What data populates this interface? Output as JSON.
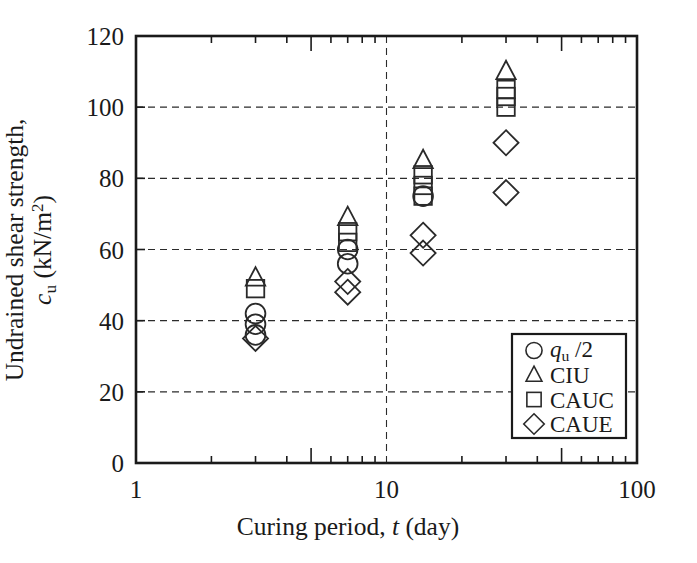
{
  "chart_data": {
    "type": "scatter",
    "title": "",
    "xlabel": "Curing period, t  (day)",
    "ylabel": "Undrained shear strength, c_u (kN/m^2)",
    "xscale": "log",
    "yscale": "linear",
    "xlim": [
      1,
      100
    ],
    "ylim": [
      0,
      120
    ],
    "xticks": [
      "1",
      "10",
      "100"
    ],
    "xtick_values": [
      1,
      10,
      100
    ],
    "yticks": [
      "0",
      "20",
      "40",
      "60",
      "80",
      "100",
      "120"
    ],
    "ytick_values": [
      0,
      20,
      40,
      60,
      80,
      100,
      120
    ],
    "grid": "dashed horizontal and vertical",
    "legend_position": "lower right inside axes",
    "series": [
      {
        "name": "qu/2",
        "marker": "circle",
        "points": [
          {
            "x": 3,
            "y": 42
          },
          {
            "x": 3,
            "y": 39
          },
          {
            "x": 3,
            "y": 36
          },
          {
            "x": 7,
            "y": 60
          },
          {
            "x": 7,
            "y": 56
          },
          {
            "x": 14,
            "y": 75
          }
        ]
      },
      {
        "name": "CIU",
        "marker": "triangle",
        "points": [
          {
            "x": 3,
            "y": 52
          },
          {
            "x": 7,
            "y": 69
          },
          {
            "x": 14,
            "y": 85
          },
          {
            "x": 30,
            "y": 110
          }
        ]
      },
      {
        "name": "CAUC",
        "marker": "square",
        "points": [
          {
            "x": 3,
            "y": 49
          },
          {
            "x": 7,
            "y": 65
          },
          {
            "x": 7,
            "y": 62
          },
          {
            "x": 14,
            "y": 81
          },
          {
            "x": 14,
            "y": 78
          },
          {
            "x": 14,
            "y": 75
          },
          {
            "x": 30,
            "y": 105
          },
          {
            "x": 30,
            "y": 103
          },
          {
            "x": 30,
            "y": 100
          }
        ]
      },
      {
        "name": "CAUE",
        "marker": "diamond",
        "points": [
          {
            "x": 3,
            "y": 35
          },
          {
            "x": 7,
            "y": 51
          },
          {
            "x": 7,
            "y": 48
          },
          {
            "x": 14,
            "y": 64
          },
          {
            "x": 14,
            "y": 59
          },
          {
            "x": 30,
            "y": 90
          },
          {
            "x": 30,
            "y": 76
          }
        ]
      }
    ]
  },
  "axes": {
    "x_title_prefix": "Curing period, ",
    "x_title_var": "t",
    "x_title_suffix": "  (day)",
    "y_title_line1": "Undrained shear strength,",
    "y_title_c": "c",
    "y_title_c_sub": "u",
    "y_title_units_open": "  (kN/m",
    "y_title_units_sup": "2",
    "y_title_units_close": ")"
  },
  "legend": {
    "entries": [
      {
        "marker": "circle",
        "label": "",
        "label_q": "q",
        "label_sub": "u",
        "label_rest": " /2"
      },
      {
        "marker": "triangle",
        "label": "CIU"
      },
      {
        "marker": "square",
        "label": "CAUC"
      },
      {
        "marker": "diamond",
        "label": "CAUE"
      }
    ]
  },
  "colors": {
    "line": "#1a1a1a",
    "marker": "#2a2a2a",
    "grid": "#2b2b2b",
    "background": "#ffffff"
  }
}
